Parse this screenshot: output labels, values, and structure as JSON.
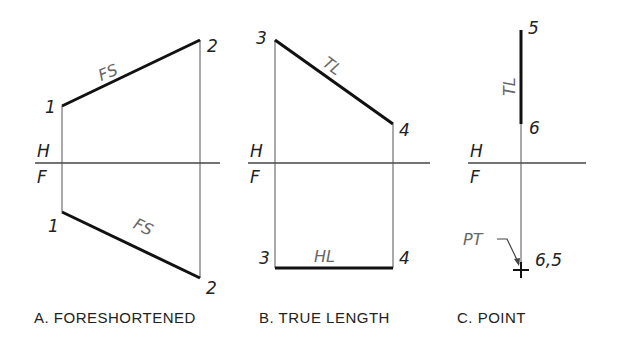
{
  "views": [
    {
      "caption": "A. FORESHORTENED",
      "fold_labels": {
        "top": "H",
        "bottom": "F"
      },
      "top_view": {
        "start_label": "1",
        "end_label": "2",
        "line_label": "FS"
      },
      "front_view": {
        "start_label": "1",
        "end_label": "2",
        "line_label": "FS"
      }
    },
    {
      "caption": "B. TRUE LENGTH",
      "fold_labels": {
        "top": "H",
        "bottom": "F"
      },
      "top_view": {
        "start_label": "3",
        "end_label": "4",
        "line_label": "TL"
      },
      "front_view": {
        "start_label": "3",
        "end_label": "4",
        "line_label": "HL"
      }
    },
    {
      "caption": "C. POINT",
      "fold_labels": {
        "top": "H",
        "bottom": "F"
      },
      "top_view": {
        "start_label": "5",
        "end_label": "6",
        "line_label": "TL"
      },
      "front_view": {
        "point_label": "6,5",
        "callout": "PT"
      }
    }
  ]
}
